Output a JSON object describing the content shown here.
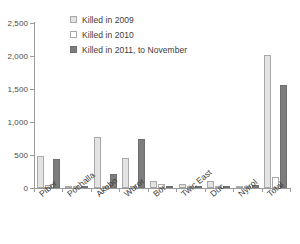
{
  "chart_data": {
    "type": "bar",
    "title": "",
    "subtitle": "",
    "xlabel": "",
    "ylabel": "",
    "ylim": [
      0,
      2500
    ],
    "ytick_labels": [
      "0",
      "500",
      "1,000",
      "1,500",
      "2,000",
      "2,500"
    ],
    "ytick_values": [
      0,
      500,
      1000,
      1500,
      2000,
      2500
    ],
    "grid": false,
    "legend_position": "top-center",
    "categories": [
      "Pibor",
      "Pochalla",
      "Akobo",
      "Wuror",
      "Bor",
      "Twic East",
      "Duc",
      "Nyirol",
      "Total"
    ],
    "series": [
      {
        "name": "Killed in 2009",
        "color": "#e3e3e3",
        "values": [
          490,
          8,
          770,
          455,
          100,
          60,
          100,
          5,
          2020
        ]
      },
      {
        "name": "Killed in 2010",
        "color": "#fdfdfd",
        "values": [
          50,
          5,
          25,
          20,
          55,
          20,
          10,
          5,
          170
        ]
      },
      {
        "name": "Killed in 2011, to November",
        "color": "#7d7d7d",
        "values": [
          435,
          8,
          215,
          750,
          35,
          20,
          25,
          45,
          1555
        ]
      }
    ]
  },
  "legend": {
    "items": [
      {
        "label": "Killed in 2009",
        "swatch": "light-gray-swatch"
      },
      {
        "label": "Killed in 2010",
        "swatch": "white-swatch"
      },
      {
        "label": "Killed in 2011, to November",
        "swatch": "dark-gray-swatch"
      }
    ]
  },
  "colors": {
    "series_2009": "#e3e3e3",
    "series_2010": "#fdfdfd",
    "series_2011": "#7d7d7d",
    "axis": "#9a9a9a",
    "text": "#3b3b3b",
    "background": "#ffffff"
  }
}
